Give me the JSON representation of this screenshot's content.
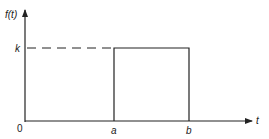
{
  "diagram": {
    "y_axis_label": "f(t)",
    "x_axis_label": "t",
    "level_label": "k",
    "origin_label": "0",
    "pulse_start_label": "a",
    "pulse_end_label": "b",
    "colors": {
      "line": "#222222",
      "background": "#ffffff"
    }
  }
}
